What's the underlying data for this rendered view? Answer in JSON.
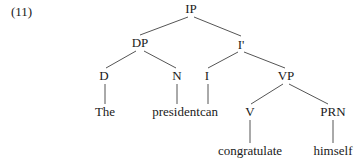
{
  "example_number": "(11)",
  "tree": {
    "nodes": [
      {
        "id": "IP",
        "label": "IP",
        "x": 191,
        "y": 9,
        "type": "phrase"
      },
      {
        "id": "DP",
        "label": "DP",
        "x": 140,
        "y": 43,
        "type": "phrase"
      },
      {
        "id": "Ibar",
        "label": "I'",
        "x": 241,
        "y": 45,
        "type": "phrase"
      },
      {
        "id": "D",
        "label": "D",
        "x": 104,
        "y": 76,
        "type": "head"
      },
      {
        "id": "N",
        "label": "N",
        "x": 177,
        "y": 76,
        "type": "head"
      },
      {
        "id": "I",
        "label": "I",
        "x": 207,
        "y": 76,
        "type": "head"
      },
      {
        "id": "VP",
        "label": "VP",
        "x": 286,
        "y": 76,
        "type": "phrase"
      },
      {
        "id": "The",
        "label": "The",
        "x": 105,
        "y": 112,
        "type": "word"
      },
      {
        "id": "president",
        "label": "president",
        "x": 176,
        "y": 112,
        "type": "word"
      },
      {
        "id": "can",
        "label": "can",
        "x": 209,
        "y": 112,
        "type": "word"
      },
      {
        "id": "V",
        "label": "V",
        "x": 250,
        "y": 112,
        "type": "head"
      },
      {
        "id": "PRN",
        "label": "PRN",
        "x": 333,
        "y": 112,
        "type": "head"
      },
      {
        "id": "congratulate",
        "label": "congratulate",
        "x": 250,
        "y": 151,
        "type": "word"
      },
      {
        "id": "himself",
        "label": "himself",
        "x": 333,
        "y": 151,
        "type": "word"
      }
    ],
    "edges": [
      {
        "from": "IP",
        "to": "DP",
        "x1": 188,
        "y1": 17,
        "x2": 140,
        "y2": 35
      },
      {
        "from": "IP",
        "to": "Ibar",
        "x1": 194,
        "y1": 17,
        "x2": 241,
        "y2": 36
      },
      {
        "from": "DP",
        "to": "D",
        "x1": 136,
        "y1": 51,
        "x2": 106,
        "y2": 68
      },
      {
        "from": "DP",
        "to": "N",
        "x1": 144,
        "y1": 51,
        "x2": 176,
        "y2": 68
      },
      {
        "from": "Ibar",
        "to": "I",
        "x1": 238,
        "y1": 52,
        "x2": 208,
        "y2": 68
      },
      {
        "from": "Ibar",
        "to": "VP",
        "x1": 244,
        "y1": 52,
        "x2": 285,
        "y2": 68
      },
      {
        "from": "D",
        "to": "The",
        "x1": 105,
        "y1": 84,
        "x2": 105,
        "y2": 104
      },
      {
        "from": "N",
        "to": "president",
        "x1": 177,
        "y1": 84,
        "x2": 177,
        "y2": 104
      },
      {
        "from": "I",
        "to": "can",
        "x1": 208,
        "y1": 84,
        "x2": 208,
        "y2": 104
      },
      {
        "from": "VP",
        "to": "V",
        "x1": 283,
        "y1": 84,
        "x2": 251,
        "y2": 104
      },
      {
        "from": "VP",
        "to": "PRN",
        "x1": 289,
        "y1": 84,
        "x2": 328,
        "y2": 104
      },
      {
        "from": "V",
        "to": "congratulate",
        "x1": 250,
        "y1": 120,
        "x2": 250,
        "y2": 143
      },
      {
        "from": "PRN",
        "to": "himself",
        "x1": 333,
        "y1": 120,
        "x2": 333,
        "y2": 143
      }
    ]
  }
}
